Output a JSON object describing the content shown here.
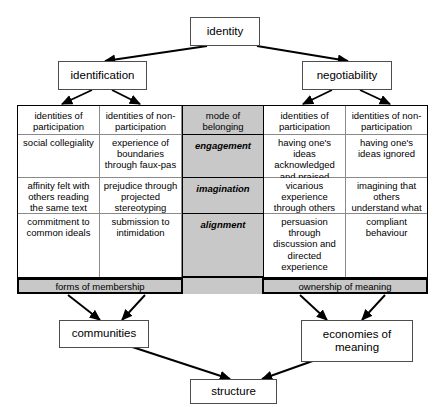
{
  "diagram": {
    "nodes": {
      "identity": "identity",
      "identification": "identification",
      "negotiability": "negotiability",
      "communities": "communities",
      "economies_of_meaning": "economies of meaning",
      "structure": "structure"
    },
    "matrix": {
      "headers": {
        "col1": "identities of participation",
        "col2": "identities of non-participation",
        "col3": "mode of belonging",
        "col4": "identities of participation",
        "col5": "identities of non-participation"
      },
      "rows": [
        {
          "mode": "engagement",
          "identification_participation": "social collegiality",
          "identification_nonparticipation": "experience of boundaries through faux-pas",
          "negotiability_participation": "having one's ideas acknowledged and praised",
          "negotiability_nonparticipation": "having one's ideas ignored"
        },
        {
          "mode": "imagination",
          "identification_participation": "affinity felt with others reading the same text",
          "identification_nonparticipation": "prejudice through projected stereotyping",
          "negotiability_participation": "vicarious experience through others",
          "negotiability_nonparticipation": "imagining that others understand what you don't"
        },
        {
          "mode": "alignment",
          "identification_participation": "commitment to common ideals",
          "identification_nonparticipation": "submission to intimidation",
          "negotiability_participation": "persuasion through discussion and directed experience",
          "negotiability_nonparticipation": "compliant behaviour"
        }
      ]
    },
    "footers": {
      "left": "forms of membership",
      "right": "ownership of meaning"
    },
    "colors": {
      "gray_fill": "#c8c8c8",
      "line": "#000000",
      "cell_border": "#8a8a8a",
      "box_border": "#4d4d4d",
      "background": "#ffffff"
    }
  }
}
